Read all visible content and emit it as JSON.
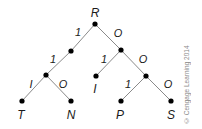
{
  "diagram": {
    "type": "binary-tree",
    "root_label": "R",
    "colors": {
      "edge": "#8a8a8a",
      "node": "#000000",
      "text": "#1a1a1a",
      "copyright": "#8a8a8a"
    },
    "nodes": [
      {
        "id": "root",
        "label": "R",
        "x": 95,
        "y": 24
      },
      {
        "id": "n1",
        "label": "",
        "x": 71,
        "y": 51
      },
      {
        "id": "n2",
        "label": "",
        "x": 121,
        "y": 50
      },
      {
        "id": "n3",
        "label": "",
        "x": 46,
        "y": 75
      },
      {
        "id": "leafI",
        "label": "I",
        "x": 96,
        "y": 76
      },
      {
        "id": "n4",
        "label": "",
        "x": 146,
        "y": 76
      },
      {
        "id": "leafT",
        "label": "T",
        "x": 22,
        "y": 101
      },
      {
        "id": "leafN",
        "label": "N",
        "x": 71,
        "y": 101
      },
      {
        "id": "leafP",
        "label": "P",
        "x": 121,
        "y": 101
      },
      {
        "id": "leafS",
        "label": "S",
        "x": 171,
        "y": 101
      }
    ],
    "edges": [
      {
        "from": "root",
        "to": "n1",
        "label": "1"
      },
      {
        "from": "root",
        "to": "n2",
        "label": "O"
      },
      {
        "from": "n1",
        "to": "n3",
        "label": "1"
      },
      {
        "from": "n3",
        "to": "leafT",
        "label": "I"
      },
      {
        "from": "n3",
        "to": "leafN",
        "label": "O"
      },
      {
        "from": "n2",
        "to": "leafI",
        "label": "1"
      },
      {
        "from": "n2",
        "to": "n4",
        "label": "O"
      },
      {
        "from": "n4",
        "to": "leafP",
        "label": "1"
      },
      {
        "from": "n4",
        "to": "leafS",
        "label": "O"
      }
    ],
    "labels": {
      "root": "R",
      "leaf_t": "T",
      "leaf_n": "N",
      "leaf_i": "I",
      "leaf_p": "P",
      "leaf_s": "S",
      "edge_root_left": "1",
      "edge_root_right": "O",
      "edge_n1_left": "1",
      "edge_n3_left": "I",
      "edge_n3_right": "O",
      "edge_n2_left": "1",
      "edge_n2_right": "O",
      "edge_n4_left": "1",
      "edge_n4_right": "O"
    },
    "copyright": "© Cengage Learning 2014"
  }
}
